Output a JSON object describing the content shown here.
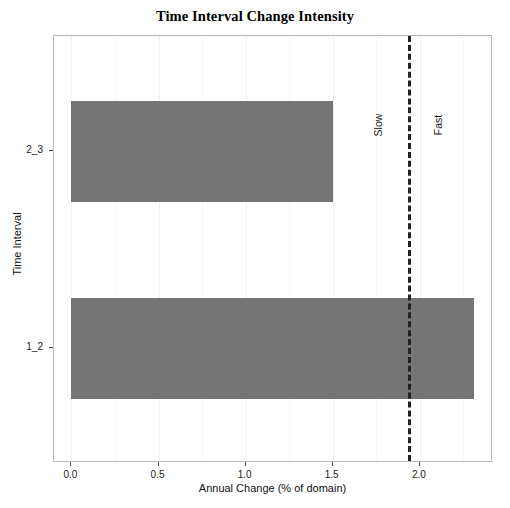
{
  "chart_data": {
    "type": "bar",
    "orientation": "horizontal",
    "title": "Time Interval Change Intensity",
    "xlabel": "Annual Change (% of domain)",
    "ylabel": "Time Interval",
    "categories": [
      "1_2",
      "2_3"
    ],
    "values": [
      2.31,
      1.5
    ],
    "series": [
      {
        "name": "Annual Change",
        "values": [
          2.31,
          1.5
        ],
        "color": "#757575"
      }
    ],
    "xlim": [
      -0.1,
      2.42
    ],
    "xticks": [
      0.0,
      0.5,
      1.0,
      1.5,
      2.0
    ],
    "xtick_labels": [
      "0.0",
      "0.5",
      "1.0",
      "1.5",
      "2.0"
    ],
    "xminor_ticks": [
      0.25,
      0.75,
      1.25,
      1.75,
      2.25
    ],
    "ytick_labels": [
      "2_3",
      "1_2"
    ],
    "grid": true,
    "legend": false,
    "annotations": [
      {
        "type": "vline",
        "name": "uniform-intensity-line",
        "value": 1.93,
        "style": "dashed",
        "color": "#222222",
        "left_label": "Slow",
        "right_label": "Fast"
      }
    ]
  },
  "figure": {
    "background": "#ffffff",
    "panel_border": "#b9b9b9",
    "bar_color": "#757575",
    "threshold_color": "#222222"
  }
}
